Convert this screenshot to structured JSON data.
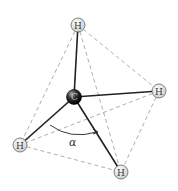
{
  "diagram": {
    "central_atom": {
      "label": "C",
      "x": 74,
      "y": 97,
      "r": 7
    },
    "atoms": [
      {
        "id": "h-top",
        "label": "H",
        "x": 78,
        "y": 25
      },
      {
        "id": "h-right",
        "label": "H",
        "x": 159,
        "y": 91
      },
      {
        "id": "h-left",
        "label": "H",
        "x": 20,
        "y": 145
      },
      {
        "id": "h-bottom",
        "label": "H",
        "x": 121,
        "y": 172
      }
    ],
    "angle_label": "α",
    "colors": {
      "bond": "#222222",
      "dashed_edge": "#999999",
      "h_fill": "#eeeeee",
      "c_fill": "#222222"
    }
  }
}
